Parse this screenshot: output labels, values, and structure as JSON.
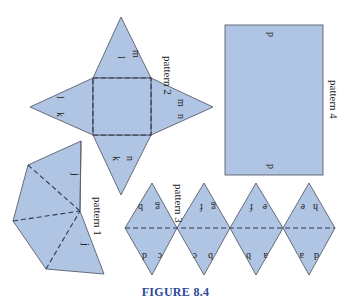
{
  "figure": {
    "caption": "Figure 8.4",
    "caption_display": "FIGURE 8.4",
    "fill_color": "#b0c4e4",
    "edge_color": "#5a5f6a",
    "fold_color": "#2e3a55",
    "caption_color": "#2a4a9a"
  },
  "patterns": [
    {
      "id": "pattern-1",
      "label": "pattern 1",
      "shape": "four-triangle fan",
      "face_letters": [
        "j",
        "j"
      ]
    },
    {
      "id": "pattern-2",
      "label": "pattern 2",
      "shape": "square pyramid net",
      "face_letters": [
        "l",
        "m",
        "k",
        "l",
        "m",
        "n",
        "k",
        "n"
      ]
    },
    {
      "id": "pattern-3",
      "label": "pattern 3",
      "shape": "strip of 8 triangles (4 rhombi)",
      "face_letters": [
        "b",
        "g",
        "f",
        "g",
        "f",
        "e",
        "e",
        "h",
        "d",
        "c",
        "c",
        "b",
        "b",
        "a",
        "a",
        "d"
      ]
    },
    {
      "id": "pattern-4",
      "label": "pattern 4",
      "shape": "rectangle",
      "face_letters": [
        "p",
        "p"
      ]
    }
  ]
}
